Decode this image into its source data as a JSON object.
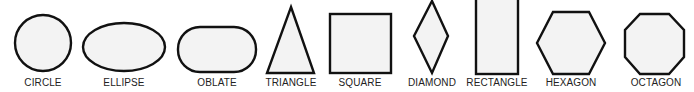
{
  "diagram": {
    "colors": {
      "fill": "#f3f3f3",
      "stroke": "#111111",
      "label": "#222222",
      "background": "#ffffff"
    },
    "shapes": [
      {
        "id": "circle",
        "label": "CIRCLE",
        "label_x": 43
      },
      {
        "id": "ellipse",
        "label": "ELLIPSE",
        "label_x": 124
      },
      {
        "id": "oblate",
        "label": "OBLATE",
        "label_x": 217
      },
      {
        "id": "triangle",
        "label": "TRIANGLE",
        "label_x": 291
      },
      {
        "id": "square",
        "label": "SQUARE",
        "label_x": 360
      },
      {
        "id": "diamond",
        "label": "DIAMOND",
        "label_x": 432
      },
      {
        "id": "rectangle",
        "label": "RECTANGLE",
        "label_x": 497
      },
      {
        "id": "hexagon",
        "label": "HEXAGON",
        "label_x": 571
      },
      {
        "id": "octagon",
        "label": "OCTAGON",
        "label_x": 656
      }
    ]
  }
}
